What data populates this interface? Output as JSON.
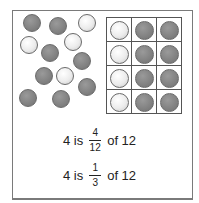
{
  "diagram": {
    "colors": {
      "gray_counter": "#8a8a8a",
      "white_counter": "#f2f2f2",
      "frame": "#7a7a7a"
    },
    "scattered_counters": [
      {
        "x": 23,
        "y": 14,
        "color": "gray"
      },
      {
        "x": 49,
        "y": 17,
        "color": "gray"
      },
      {
        "x": 78,
        "y": 14,
        "color": "white"
      },
      {
        "x": 20,
        "y": 36,
        "color": "white"
      },
      {
        "x": 64,
        "y": 33,
        "color": "white"
      },
      {
        "x": 41,
        "y": 44,
        "color": "gray"
      },
      {
        "x": 73,
        "y": 52,
        "color": "gray"
      },
      {
        "x": 35,
        "y": 67,
        "color": "gray"
      },
      {
        "x": 56,
        "y": 67,
        "color": "white"
      },
      {
        "x": 78,
        "y": 78,
        "color": "gray"
      },
      {
        "x": 19,
        "y": 89,
        "color": "gray"
      },
      {
        "x": 52,
        "y": 90,
        "color": "gray"
      }
    ],
    "grid": {
      "rows": 4,
      "cols": 3,
      "cells": [
        [
          "white",
          "gray",
          "gray"
        ],
        [
          "white",
          "gray",
          "gray"
        ],
        [
          "white",
          "gray",
          "gray"
        ],
        [
          "white",
          "gray",
          "gray"
        ]
      ]
    },
    "equations": [
      {
        "prefix": "4 is",
        "numerator": "4",
        "denominator": "12",
        "suffix": "of 12"
      },
      {
        "prefix": "4 is",
        "numerator": "1",
        "denominator": "3",
        "suffix": "of 12"
      }
    ]
  }
}
